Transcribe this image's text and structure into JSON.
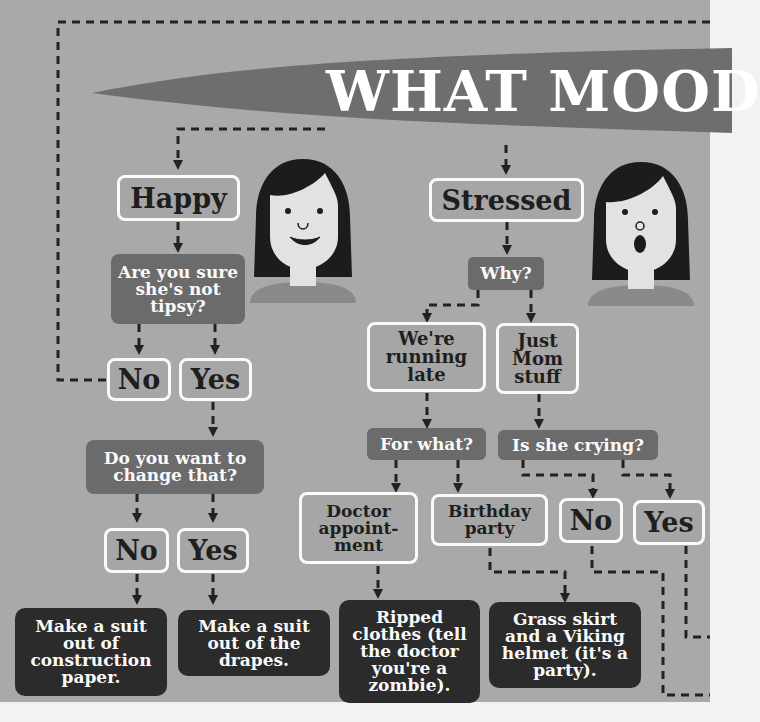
{
  "title": "WHAT MOOD",
  "colors": {
    "background": "#a9a9a9",
    "banner": "#6e6e6e",
    "question_box": "#6b6b6b",
    "answer_box": "#2b2b2b",
    "outline": "#fafafa",
    "connector": "#222222",
    "hair": "#1c1c1c",
    "skin": "#e2e2e2",
    "shirt": "#8a8a8a"
  },
  "moods": {
    "happy": {
      "label": "Happy",
      "face": "smiling-woman",
      "question": "Are you sure she's not tipsy?",
      "options": {
        "no": "No",
        "yes": "Yes"
      },
      "followup": {
        "question": "Do you want to change that?",
        "options": {
          "no": "No",
          "yes": "Yes"
        },
        "results": {
          "no": "Make a suit out of construction paper.",
          "yes": "Make a suit out of the drapes."
        }
      }
    },
    "stressed": {
      "label": "Stressed",
      "face": "surprised-woman",
      "question": "Why?",
      "options": {
        "running_late": "We're running late",
        "mom_stuff": "Just Mom stuff"
      },
      "running_late": {
        "question": "For what?",
        "options": {
          "doctor": "Doctor appoint- ment",
          "birthday": "Birthday party"
        },
        "results": {
          "doctor": "Ripped clothes (tell the doctor you're a zombie).",
          "birthday": "Grass skirt and a Viking helmet (it's a party)."
        }
      },
      "mom_stuff": {
        "question": "Is she crying?",
        "options": {
          "no": "No",
          "yes": "Yes"
        }
      }
    }
  }
}
